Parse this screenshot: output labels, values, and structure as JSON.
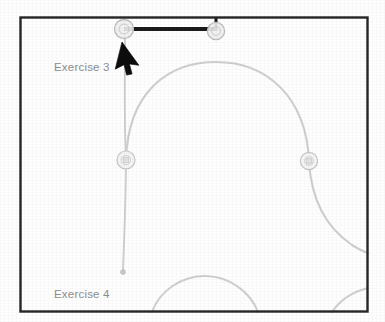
{
  "canvas": {
    "width": 385,
    "height": 322,
    "background_color": "#fefefe",
    "border_color": "#262626",
    "frame": {
      "x": 20,
      "y": 17,
      "width": 348,
      "height": 295
    }
  },
  "labels": {
    "exercise_3": "Exercise 3",
    "exercise_4": "Exercise 4",
    "text_color": "#8c8c8c"
  },
  "colors": {
    "faint_stroke": "#cfcfcf",
    "node_fill": "#f2f2f2",
    "node_stroke": "#c6c6c6",
    "selected_stroke": "#1a1a1a",
    "cursor_fill": "#0d0d0d"
  },
  "nodes": [
    {
      "id": "node-top-left",
      "cx": 124,
      "cy": 29,
      "r": 9.5,
      "state": "selected-endpoint"
    },
    {
      "id": "node-top-right",
      "cx": 216,
      "cy": 30,
      "r": 8.5,
      "state": "selected-endpoint"
    },
    {
      "id": "node-mid-left",
      "cx": 126,
      "cy": 160,
      "r": 9.0,
      "state": "normal"
    },
    {
      "id": "node-mid-right",
      "cx": 309,
      "cy": 161,
      "r": 8.5,
      "state": "normal"
    },
    {
      "id": "node-line-end",
      "cx": 123,
      "cy": 272,
      "r": 2.2,
      "state": "terminal-dot"
    }
  ],
  "edges": [
    {
      "id": "edge-selected-horizontal",
      "kind": "straight",
      "style": "selected",
      "from": "node-top-left",
      "to": "node-top-right"
    },
    {
      "id": "edge-selected-riser",
      "kind": "straight",
      "style": "selected",
      "from": "node-top-right",
      "to": "frame-top"
    },
    {
      "id": "edge-vertical-left",
      "kind": "straight",
      "style": "faint",
      "from": "node-top-left",
      "to": "node-line-end"
    },
    {
      "id": "edge-arc-main",
      "kind": "arc",
      "style": "faint",
      "from": "node-mid-left",
      "to": "node-mid-right"
    },
    {
      "id": "edge-arc-tail-right",
      "kind": "arc",
      "style": "faint",
      "from": "node-mid-right",
      "to": "frame-right"
    },
    {
      "id": "edge-arc-bottom",
      "kind": "arc",
      "style": "faint",
      "from": "frame-bottom-left",
      "to": "frame-bottom-right"
    },
    {
      "id": "edge-arc-bottom-corner",
      "kind": "arc",
      "style": "faint",
      "from": "frame-bottom-right",
      "to": "frame-right"
    }
  ],
  "cursor": {
    "name": "mouse-pointer",
    "x": 124,
    "y": 44,
    "rotation_deg": 18,
    "color": "#0d0d0d"
  }
}
